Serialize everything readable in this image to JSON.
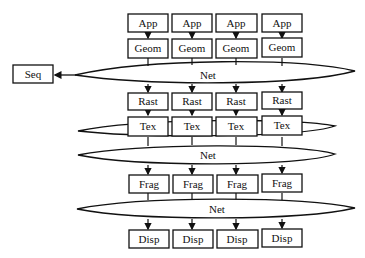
{
  "diagram": {
    "columns": 4,
    "stages": {
      "app": {
        "label": "App",
        "nodes": [
          "App",
          "App",
          "App",
          "App"
        ]
      },
      "geom": {
        "label": "Geom",
        "nodes": [
          "Geom",
          "Geom",
          "Geom",
          "Geom"
        ]
      },
      "rast": {
        "label": "Rast",
        "nodes": [
          "Rast",
          "Rast",
          "Rast",
          "Rast"
        ]
      },
      "tex": {
        "label": "Tex",
        "nodes": [
          "Tex",
          "Tex",
          "Tex",
          "Tex"
        ]
      },
      "frag": {
        "label": "Frag",
        "nodes": [
          "Frag",
          "Frag",
          "Frag",
          "Frag"
        ]
      },
      "disp": {
        "label": "Disp",
        "nodes": [
          "Disp",
          "Disp",
          "Disp",
          "Disp"
        ]
      }
    },
    "networks": [
      {
        "label": "Net"
      },
      {
        "label": ""
      },
      {
        "label": "Net"
      },
      {
        "label": "Net"
      }
    ],
    "sequencer": {
      "label": "Seq"
    },
    "colors": {
      "stroke": "#111111",
      "fill": "#ffffff",
      "text": "#111111"
    }
  }
}
